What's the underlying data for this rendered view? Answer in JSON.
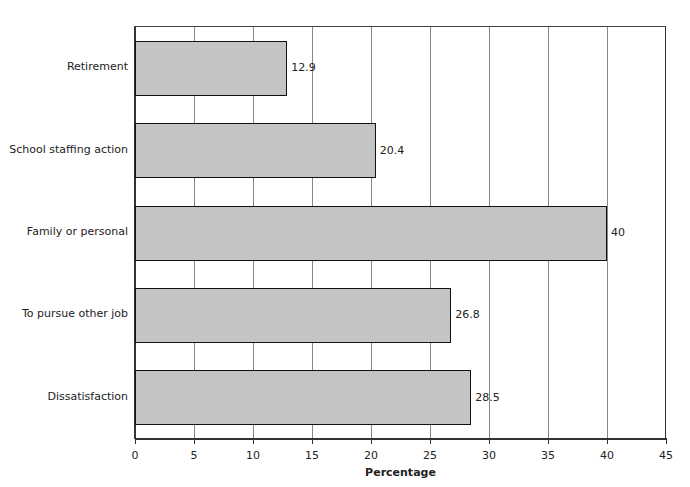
{
  "chart_data": {
    "type": "bar",
    "orientation": "horizontal",
    "title": "",
    "xlabel": "Percentage",
    "ylabel": "",
    "categories": [
      "Retirement",
      "School staffing action",
      "Family or personal",
      "To pursue other job",
      "Dissatisfaction"
    ],
    "values": [
      12.9,
      20.4,
      40,
      26.8,
      28.5
    ],
    "value_labels": [
      "12.9",
      "20.4",
      "40",
      "26.8",
      "28.5"
    ],
    "xlim": [
      0,
      45
    ],
    "xticks": [
      0,
      5,
      10,
      15,
      20,
      25,
      30,
      35,
      40,
      45
    ],
    "xtick_labels": [
      "0",
      "5",
      "10",
      "15",
      "20",
      "25",
      "30",
      "35",
      "40",
      "45"
    ],
    "grid": {
      "vertical": true,
      "horizontal": false
    },
    "legend": null,
    "bar_color": "#c4c4c4",
    "bar_edge_color": "#111111"
  }
}
